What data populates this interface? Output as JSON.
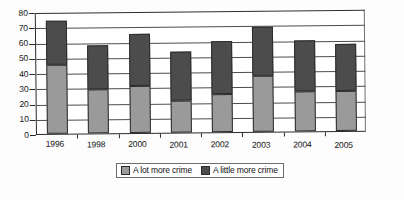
{
  "chart_data": {
    "type": "bar",
    "title": "",
    "subtitle": "",
    "xlabel": "",
    "ylabel": "",
    "stacked": true,
    "grid": true,
    "legend_position": "bottom",
    "ylim": [
      0,
      80
    ],
    "yticks": [
      0,
      10,
      20,
      30,
      40,
      50,
      60,
      70,
      80
    ],
    "ytick_labels": [
      "0",
      "10",
      "20",
      "30",
      "40",
      "50",
      "60",
      "70",
      "80"
    ],
    "categories": [
      "1996",
      "1998",
      "2000",
      "2001",
      "2002",
      "2003",
      "2004",
      "2005"
    ],
    "series": [
      {
        "name": "A lot more crime",
        "color": "#9a9a9a",
        "values": [
          45,
          29,
          31,
          21,
          25,
          37,
          26,
          26
        ]
      },
      {
        "name": "A little more crime",
        "color": "#4c4c4c",
        "values": [
          29,
          29,
          34,
          32,
          35,
          32,
          34,
          31
        ]
      }
    ],
    "totals": [
      74,
      58,
      65,
      53,
      60,
      69,
      60,
      57
    ]
  },
  "legend": {
    "items": [
      {
        "label": "A lot more crime",
        "swatch": "legend-swatch-a-lot-more-crime"
      },
      {
        "label": "A little more crime",
        "swatch": "legend-swatch-a-little-more-crime"
      }
    ]
  }
}
